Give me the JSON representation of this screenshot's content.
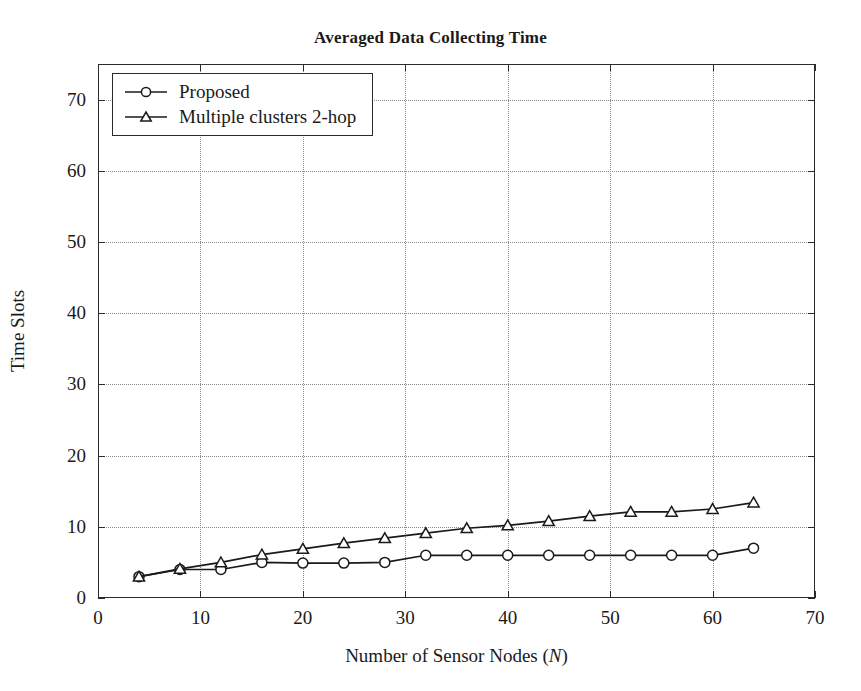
{
  "chart_data": {
    "type": "line",
    "title": "Averaged Data Collecting Time",
    "xlabel": "Number of Sensor Nodes (N)",
    "xlabel_symbol": "N",
    "ylabel": "Time Slots",
    "xlim": [
      0,
      70
    ],
    "ylim": [
      0,
      75
    ],
    "xticks": [
      0,
      10,
      20,
      30,
      40,
      50,
      60,
      70
    ],
    "yticks": [
      0,
      10,
      20,
      30,
      40,
      50,
      60,
      70
    ],
    "grid": true,
    "grid_style": "dotted",
    "legend_position": "top-left",
    "x": [
      4,
      8,
      12,
      16,
      20,
      24,
      28,
      32,
      36,
      40,
      44,
      48,
      52,
      56,
      60,
      64
    ],
    "series": [
      {
        "name": "Proposed",
        "marker": "circle",
        "color": "#1a1a1a",
        "values": [
          3.0,
          4.0,
          4.0,
          5.0,
          4.9,
          4.9,
          5.0,
          6.0,
          6.0,
          6.0,
          6.0,
          6.0,
          6.0,
          6.0,
          6.0,
          7.0
        ]
      },
      {
        "name": "Multiple clusters 2-hop",
        "marker": "triangle",
        "color": "#1a1a1a",
        "values": [
          3.0,
          4.1,
          5.0,
          6.1,
          6.9,
          7.7,
          8.4,
          9.1,
          9.8,
          10.2,
          10.8,
          11.5,
          12.1,
          12.1,
          12.5,
          13.4
        ]
      }
    ]
  },
  "legend": {
    "items": [
      {
        "label": "Proposed",
        "marker": "circle-marker"
      },
      {
        "label": "Multiple clusters 2-hop",
        "marker": "triangle-marker"
      }
    ]
  },
  "axis": {
    "y_tick_labels": [
      "0",
      "10",
      "20",
      "30",
      "40",
      "50",
      "60",
      "70"
    ],
    "x_tick_labels": [
      "0",
      "10",
      "20",
      "30",
      "40",
      "50",
      "60",
      "70"
    ]
  },
  "colors": {
    "line": "#1a1a1a",
    "frame": "#2a2a2a",
    "grid": "#8a8a8a",
    "background": "#ffffff"
  }
}
